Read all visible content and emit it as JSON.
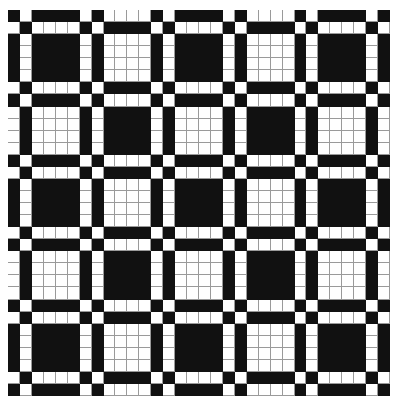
{
  "pattern": {
    "rows": 32,
    "cols": 32,
    "thread_sequence": [
      1,
      0,
      1,
      1,
      1,
      1,
      0,
      1,
      0,
      0,
      0,
      0
    ],
    "rule": "cell is dark when warp and weft thread values match",
    "colors": {
      "dark": "#111111",
      "light": "#ffffff",
      "gridline": "#9a9a9a"
    }
  }
}
